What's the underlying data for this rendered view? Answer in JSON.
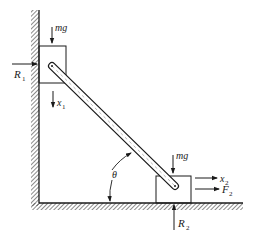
{
  "diagram": {
    "type": "mechanics-free-body",
    "colors": {
      "ink": "#1a1a1a",
      "background": "#ffffff"
    },
    "labels": {
      "mg_top": "mg",
      "mg_bottom": "mg",
      "R1": "R",
      "R1_sub": "1",
      "x1": "x",
      "x1_sub": "1",
      "x2": "x",
      "x2_sub": "2",
      "F2": "F",
      "F2_sub": "2",
      "R2": "R",
      "R2_sub": "2",
      "theta": "θ"
    },
    "elements": [
      "vertical-wall",
      "floor",
      "block-1",
      "block-2",
      "rod",
      "force-R1",
      "force-mg-1",
      "displacement-x1",
      "force-mg-2",
      "displacement-x2",
      "force-F2",
      "force-R2",
      "angle-theta"
    ]
  }
}
